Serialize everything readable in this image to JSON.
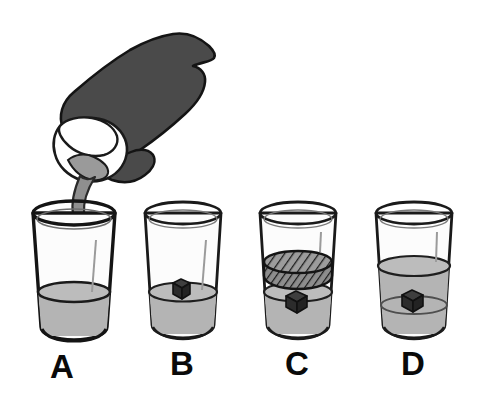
{
  "figure": {
    "background_color": "#ffffff"
  },
  "palette": {
    "outline": "#1a1a1a",
    "hand_fill": "#4a4a4a",
    "hand_outline": "#141414",
    "pitcher_fill": "#ffffff",
    "pitcher_shadow": "#9a9a9a",
    "stream_fill": "#8f8f8f",
    "liquid_fill": "#b4b4b4",
    "liquid_fill_dark": "#a2a2a2",
    "glass_fill": "#fdfdfd",
    "glass_tint": "#f2f2f2",
    "cube_fill": "#323232",
    "cube_top": "#3e3e3e",
    "cube_side": "#232323",
    "disk_fill": "#8a8a8a",
    "disk_hatch": "#1e1e1e",
    "label_color": "#0a0a0a"
  },
  "pouring": {
    "hand_name": "hand holding pitcher",
    "pitcher_name": "white pitcher tilted pouring",
    "stream_name": "liquid stream"
  },
  "panels": [
    {
      "id": "A",
      "label": "A",
      "label_x": 62,
      "label_y": 378,
      "glass": {
        "top_y": 213,
        "bottom_y": 336,
        "top_rx": 41,
        "bottom_rx": 33,
        "center_x": 74,
        "ellipse_ry": 11
      },
      "liquid": {
        "level_y": 292,
        "rx": 35,
        "ry": 10
      },
      "cube": null,
      "disk": null,
      "has_stream": true,
      "description": "Glass being filled by pouring stream, low liquid level, no cube"
    },
    {
      "id": "B",
      "label": "B",
      "label_x": 182,
      "label_y": 375,
      "glass": {
        "top_y": 213,
        "bottom_y": 334,
        "top_rx": 38,
        "bottom_rx": 31,
        "center_x": 183,
        "ellipse_ry": 10
      },
      "liquid": {
        "level_y": 292,
        "rx": 33,
        "ry": 9
      },
      "cube": {
        "cx": 181,
        "cy": 288,
        "size": 17
      },
      "disk": null,
      "has_stream": false,
      "description": "Glass with low liquid level and a dark cube floating at the surface"
    },
    {
      "id": "C",
      "label": "C",
      "label_x": 297,
      "label_y": 375,
      "glass": {
        "top_y": 213,
        "bottom_y": 334,
        "top_rx": 38,
        "bottom_rx": 31,
        "center_x": 298,
        "ellipse_ry": 10
      },
      "liquid": {
        "level_y": 292,
        "rx": 33,
        "ry": 9
      },
      "cube": {
        "cx": 296,
        "cy": 301,
        "size": 17
      },
      "disk": {
        "cy": 262,
        "rx": 34,
        "ry": 11,
        "thickness": 17
      },
      "has_stream": false,
      "description": "Glass with hatched cylindrical disk pressed above liquid and cube submerged below"
    },
    {
      "id": "D",
      "label": "D",
      "label_x": 413,
      "label_y": 375,
      "glass": {
        "top_y": 213,
        "bottom_y": 334,
        "top_rx": 38,
        "bottom_rx": 31,
        "center_x": 414,
        "ellipse_ry": 10
      },
      "liquid": {
        "level_y": 266,
        "rx": 35,
        "ry": 10
      },
      "cube": {
        "cx": 412,
        "cy": 300,
        "size": 17
      },
      "disk": null,
      "has_stream": false,
      "description": "Glass with higher liquid level and cube fully submerged mid-liquid"
    }
  ]
}
